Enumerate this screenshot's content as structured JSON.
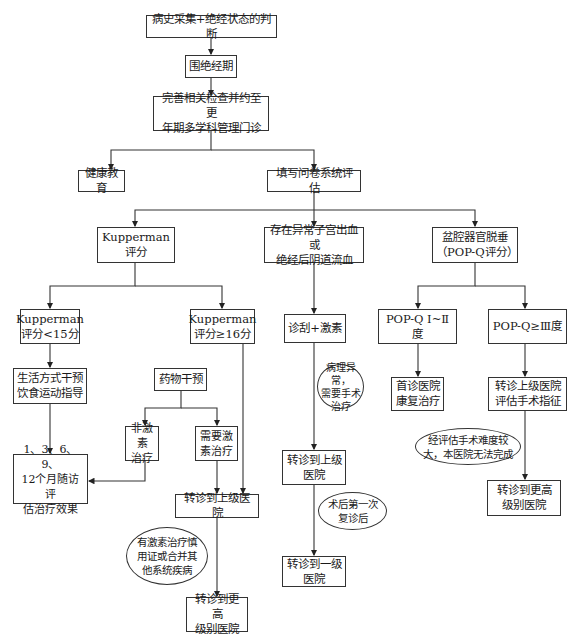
{
  "flowchart": {
    "nodes": {
      "history": "病史采集+绝经状态的判断",
      "perimenopause": "围绝经期",
      "clinic": "完善相关检查并约至更\n年期多学科管理门诊",
      "health_edu": "健康教育",
      "questionnaire": "填写问卷系统评估",
      "kupperman": "Kupperman评分",
      "bleeding": "存在异常子宫出血或\n绝经后阴道流血",
      "pop": "盆腔器官脱垂\n（POP-Q评分）",
      "kup_low": "Kupperman\n评分<15分",
      "kup_high": "Kupperman\n评分≥16分",
      "curettage": "诊刮+激素",
      "pop_low": "POP-Q Ⅰ~Ⅱ度",
      "pop_high": "POP-Q≥Ⅲ度",
      "lifestyle": "生活方式干预\n饮食运动指导",
      "drug": "药物干预",
      "rehab": "首诊医院\n康复治疗",
      "refer_eval": "转诊上级医院\n评估手术指征",
      "non_hormone": "非激素\n治疗",
      "hormone": "需要激\n素治疗",
      "followup": "1、3、6、9、\n12个月随访评\n估治疗效果",
      "refer_upper_mid": "转诊到上级医院",
      "refer_upper_center": "转诊到上级\n医院",
      "refer_higher_left": "转诊到更高\n级别医院",
      "refer_first": "转诊到一级\n医院",
      "refer_higher_right": "转诊到更高\n级别医院"
    },
    "conditions": {
      "contraindication": "有激素治疗慎\n用证或合并其\n他系统疾病",
      "pathology": "病理异常，\n需要手术\n治疗",
      "post_op": "术后第一次\n复诊后",
      "difficult": "经评估手术难度较\n大，本医院无法完成"
    }
  }
}
